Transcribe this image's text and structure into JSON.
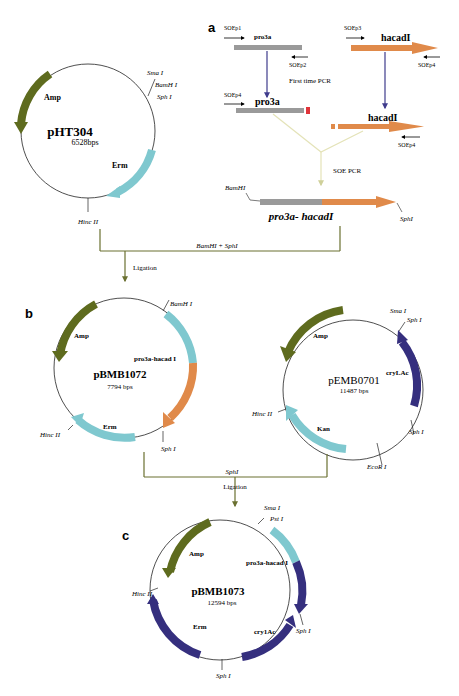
{
  "colors": {
    "amp": "#5e6b1e",
    "erm_light": "#7fc8cf",
    "orange": "#e08a4a",
    "navy": "#352f7e",
    "gray_bar": "#9a9a9a",
    "red": "#e0343a",
    "flow_line": "#6a7030",
    "soe_line": "#e4e3b8",
    "pcr_arrow": "#3f3b8c"
  },
  "panel_labels": {
    "a": "a",
    "b": "b",
    "c": "c"
  },
  "pHT304": {
    "name": "pHT304",
    "size": "6528bps",
    "genes": {
      "amp": "Amp",
      "erm": "Erm"
    },
    "sites": {
      "sma": "Sma I",
      "bam": "BamH I",
      "sph": "Sph I",
      "hinc": "Hinc II"
    }
  },
  "panel_a": {
    "soep1": "SOEp1",
    "soep2": "SOEp2",
    "soep3": "SOEp3",
    "soep4_top": "SOEp4",
    "soep4_left": "SOEp4",
    "soep4_mid": "SOEp4",
    "pro3a_top": "pro3a",
    "pro3a_mid": "pro3a",
    "hacad_top": "hacadI",
    "hacad_mid": "hacadI",
    "first_pcr": "First time PCR",
    "soe_pcr": "SOE PCR",
    "fusion_bam": "BamHI",
    "fusion_sph": "SphI",
    "fusion_label": "pro3a- hacadI"
  },
  "flow": {
    "digest1": "BamHI + SphI",
    "ligation1": "Ligation",
    "digest2": "SphI",
    "ligation2": "Ligation"
  },
  "pBMB1072": {
    "name": "pBMB1072",
    "size": "7794 bps",
    "genes": {
      "amp": "Amp",
      "insert": "pro3a-hacad I",
      "erm": "Erm"
    },
    "sites": {
      "bam": "BamH I",
      "sph": "Sph I",
      "hinc": "Hinc II"
    }
  },
  "pEMB0701": {
    "name": "pEMB0701",
    "size": "11487 bps",
    "genes": {
      "amp": "Amp",
      "cry": "cryLAc",
      "kan": "Kan"
    },
    "sites": {
      "sma": "Sma I",
      "sph_top": "Sph I",
      "sph_bottom": "Sph I",
      "ecor": "EcoR I",
      "hinc": "Hinc II"
    }
  },
  "pBMB1073": {
    "name": "pBMB1073",
    "size": "12594 bps",
    "genes": {
      "amp": "Amp",
      "insert": "pro3a-hacad I",
      "erm": "Erm",
      "cry": "cry1Ac"
    },
    "sites": {
      "sma": "Sma I",
      "pst": "Pst I",
      "sph_right": "Sph I",
      "sph_bottom": "Sph I",
      "hinc": "Hinc II"
    }
  }
}
